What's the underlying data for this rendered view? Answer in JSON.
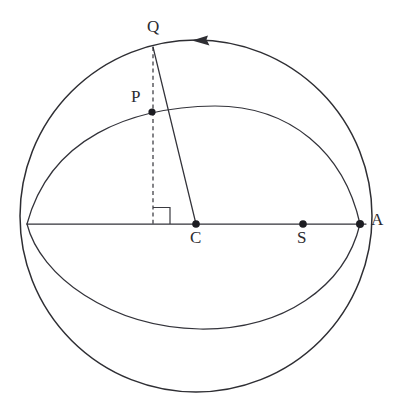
{
  "figure": {
    "background_color": "#ffffff",
    "stroke_color": "#2e2e33",
    "dot_color": "#1d1d22",
    "canvas": {
      "width": 404,
      "height": 403
    }
  },
  "geometry": {
    "sphere": {
      "name": "outline-circle",
      "center": {
        "x": 196,
        "y": 216
      },
      "radius": 176
    },
    "equator_line": {
      "name": "horizontal-axis",
      "x1": 27,
      "y1": 224,
      "x2": 366,
      "y2": 224
    },
    "orbit_ellipse": {
      "name": "tilted-orbit-ellipse",
      "left_node": {
        "x": 27,
        "y": 224
      },
      "right_node": {
        "x": 360,
        "y": 224
      },
      "top_apex": {
        "x": 215,
        "y": 106
      },
      "bottom_apex": {
        "x": 200,
        "y": 329
      }
    },
    "dashed_perpendicular": {
      "name": "dashed-drop-line",
      "x1": 153,
      "y1": 47,
      "x2": 153,
      "y2": 226
    },
    "radius_line": {
      "name": "radius-q-to-c",
      "x1": 153,
      "y1": 47,
      "x2": 196,
      "y2": 224
    },
    "right_angle_marker": {
      "name": "right-angle-square",
      "x": 153,
      "y": 207,
      "size": 17
    },
    "direction_arrow": {
      "name": "orbit-direction-arrow",
      "tip": {
        "x": 193,
        "y": 40
      },
      "points_toward": "left"
    }
  },
  "points": [
    {
      "key": "Q",
      "label": "Q",
      "name": "point-q",
      "cx": 153,
      "cy": 47,
      "r": 0,
      "label_x": 147,
      "label_y": 18,
      "has_dot": false
    },
    {
      "key": "P",
      "label": "P",
      "name": "point-p",
      "cx": 152,
      "cy": 112,
      "r": 3.6,
      "label_x": 131,
      "label_y": 88,
      "has_dot": true
    },
    {
      "key": "C",
      "label": "C",
      "name": "point-c",
      "cx": 196,
      "cy": 224,
      "r": 3.8,
      "label_x": 190,
      "label_y": 229,
      "has_dot": true
    },
    {
      "key": "S",
      "label": "S",
      "name": "point-s",
      "cx": 303,
      "cy": 224,
      "r": 3.8,
      "label_x": 297,
      "label_y": 229,
      "has_dot": true
    },
    {
      "key": "A",
      "label": "A",
      "name": "point-a",
      "cx": 360,
      "cy": 224,
      "r": 4.0,
      "label_x": 371,
      "label_y": 211,
      "has_dot": true
    }
  ],
  "labels": {
    "q": "Q",
    "p": "P",
    "c": "C",
    "s": "S",
    "a": "A"
  }
}
